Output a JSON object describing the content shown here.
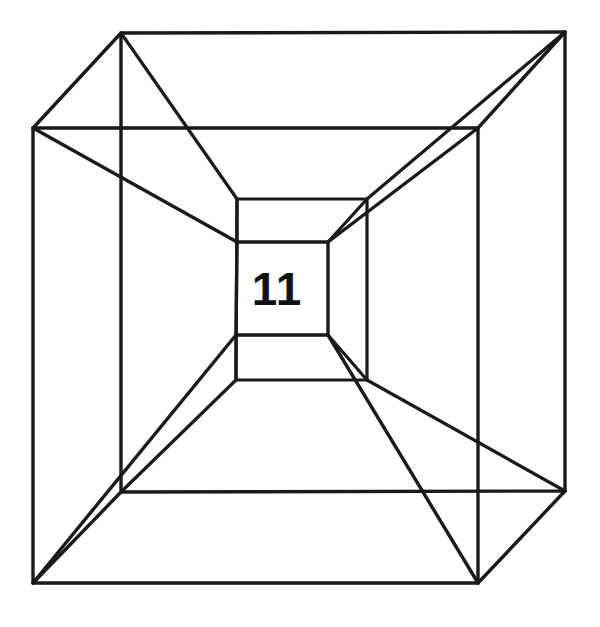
{
  "figure": {
    "center_label": "11",
    "background_color": "#ffffff",
    "line_color": "#1a1a1a",
    "line_width": 3,
    "canvas": {
      "width": 600,
      "height": 627
    }
  },
  "chart_data": {
    "type": "diagram",
    "annotations": [
      {
        "text": "11",
        "x": 277,
        "y": 288
      }
    ],
    "vertices": {
      "outer_cube_front": [
        {
          "name": "outer-front-top-left",
          "x": 33,
          "y": 128
        },
        {
          "name": "outer-front-top-right",
          "x": 478,
          "y": 128
        },
        {
          "name": "outer-front-bottom-right",
          "x": 478,
          "y": 583
        },
        {
          "name": "outer-front-bottom-left",
          "x": 33,
          "y": 583
        }
      ],
      "outer_cube_back": [
        {
          "name": "outer-back-top-left",
          "x": 121,
          "y": 33
        },
        {
          "name": "outer-back-top-right",
          "x": 565,
          "y": 32
        },
        {
          "name": "outer-back-bottom-right",
          "x": 565,
          "y": 491
        },
        {
          "name": "outer-back-bottom-left",
          "x": 121,
          "y": 492
        }
      ],
      "inner_cube_front": [
        {
          "name": "inner-front-top-left",
          "x": 237,
          "y": 242
        },
        {
          "name": "inner-front-top-right",
          "x": 328,
          "y": 242
        },
        {
          "name": "inner-front-bottom-right",
          "x": 328,
          "y": 335
        },
        {
          "name": "inner-front-bottom-left",
          "x": 236,
          "y": 335
        }
      ],
      "inner_cube_back": [
        {
          "name": "inner-back-top-left",
          "x": 237,
          "y": 199
        },
        {
          "name": "inner-back-top-right",
          "x": 367,
          "y": 199
        },
        {
          "name": "inner-back-bottom-right",
          "x": 367,
          "y": 380
        },
        {
          "name": "inner-back-bottom-left",
          "x": 236,
          "y": 380
        }
      ]
    },
    "edges": {
      "outer_front_square": "M 33 128 L 478 128 L 478 583 L 33 583 Z",
      "outer_back_square": "M 121 33 L 565 32 L 565 491 L 121 492 Z",
      "outer_connectors": [
        "M 33 128 L 121 33",
        "M 478 128 L 565 32",
        "M 478 583 L 565 491",
        "M 33 583 L 121 492"
      ],
      "inner_front_square": "M 237 242 L 328 242 L 328 335 L 236 335 Z",
      "inner_back_square": "M 237 199 L 367 199 L 367 380 L 236 380 Z",
      "inner_connectors": [
        "M 237 242 L 237 199",
        "M 328 242 L 367 199",
        "M 328 335 L 367 380",
        "M 236 335 L 236 380"
      ],
      "radial_front": [
        "M 33 128 L 237 242",
        "M 478 128 L 328 242",
        "M 478 583 L 328 335",
        "M 33 583 L 236 335"
      ],
      "radial_back": [
        "M 121 33 L 237 199",
        "M 565 32 L 367 199",
        "M 565 491 L 367 380",
        "M 121 492 L 236 380"
      ]
    }
  }
}
